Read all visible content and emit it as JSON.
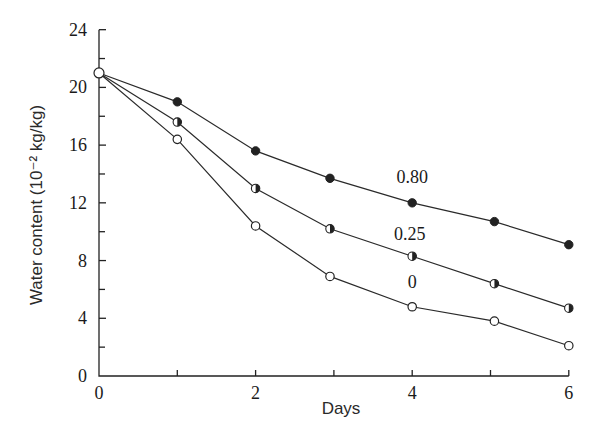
{
  "chart_data": {
    "type": "line",
    "title": "",
    "xlabel": "Days",
    "ylabel": "Water content (10⁻² kg/kg)",
    "xlim": [
      0,
      6
    ],
    "ylim": [
      0,
      24
    ],
    "x_ticks": [
      0,
      1,
      2,
      3,
      4,
      5,
      6
    ],
    "x_tick_labels": [
      "0",
      "",
      "2",
      "",
      "4",
      "",
      "6"
    ],
    "y_ticks": [
      0,
      2,
      4,
      6,
      8,
      10,
      12,
      14,
      16,
      18,
      20,
      22,
      24
    ],
    "y_tick_labels": [
      "0",
      "",
      "4",
      "",
      "8",
      "",
      "12",
      "",
      "16",
      "",
      "20",
      "",
      "24"
    ],
    "grid": false,
    "legend": "inline labels near day 4",
    "x": [
      0,
      1,
      2,
      2.95,
      4,
      5.05,
      6
    ],
    "series": [
      {
        "name": "0.80",
        "marker": "filled-circle",
        "values": [
          21,
          19.0,
          15.6,
          13.7,
          12.0,
          10.7,
          9.1
        ],
        "label_position": {
          "x": 4.0,
          "y": 13.4
        }
      },
      {
        "name": "0.25",
        "marker": "half-filled-circle",
        "values": [
          21,
          17.6,
          13.0,
          10.2,
          8.3,
          6.4,
          4.7
        ],
        "label_position": {
          "x": 3.97,
          "y": 9.4
        }
      },
      {
        "name": "0",
        "marker": "open-circle",
        "values": [
          21,
          16.4,
          10.4,
          6.9,
          4.8,
          3.8,
          2.1
        ],
        "label_position": {
          "x": 4.0,
          "y": 6.1
        }
      }
    ]
  },
  "layout": {
    "origin_px": [
      99,
      376
    ],
    "x_px_per_unit": 78.3,
    "y_px_per_unit": 14.43
  },
  "colors": {
    "ink": "#222222",
    "background": "#ffffff"
  }
}
